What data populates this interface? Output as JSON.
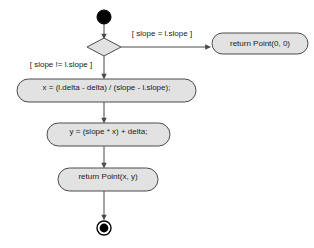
{
  "diagram": {
    "type": "uml-activity-diagram",
    "background_color": "#ffffff",
    "node_fill_color": "#e2e2e2",
    "node_border_color": "#4a4a4a",
    "text_color": "#1a1a1a",
    "initial_node": {
      "name": "initial-node",
      "cx": 104,
      "cy": 17,
      "r": 7
    },
    "decision_node": {
      "name": "decision-diamond",
      "cx": 104,
      "cy": 47,
      "half_width": 17,
      "half_height": 9
    },
    "actions": [
      {
        "id": "action-compute-x",
        "label": "x = (l.delta - delta) / (slope - l.slope);",
        "x": 17,
        "y": 79,
        "width": 179,
        "height": 23
      },
      {
        "id": "action-compute-y",
        "label": "y = (slope * x) + delta;",
        "x": 47,
        "y": 123,
        "width": 123,
        "height": 23
      },
      {
        "id": "action-return-point-xy",
        "label": "return Point(x, y)",
        "x": 58,
        "y": 168,
        "width": 100,
        "height": 23
      },
      {
        "id": "action-return-point-zero",
        "label": "return Point(0, 0)",
        "x": 212,
        "y": 33,
        "width": 96,
        "height": 21
      }
    ],
    "guards": [
      {
        "id": "guard-slope-equal",
        "label": "[ slope = l.slope ]",
        "x": 162,
        "y": 34
      },
      {
        "id": "guard-slope-not-equal",
        "label": "[ slope != l.slope ]",
        "x": 61,
        "y": 65
      }
    ],
    "final_node": {
      "name": "final-node",
      "cx": 104,
      "cy": 228,
      "outer_r": 7,
      "inner_r": 4.4
    }
  }
}
